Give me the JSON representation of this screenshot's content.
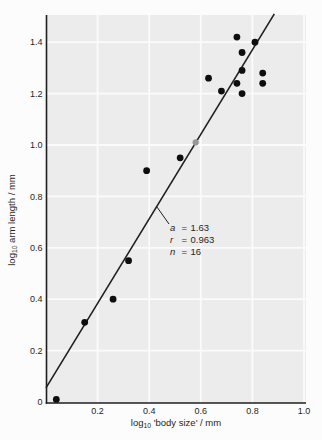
{
  "chart_data": {
    "type": "scatter",
    "title": "",
    "xlabel": {
      "pre": "log",
      "sub": "10",
      "rest": " 'body size' / mm"
    },
    "ylabel": {
      "pre": "log",
      "sub": "10",
      "rest": " arm length / mm"
    },
    "xlim": [
      0,
      1.0
    ],
    "ylim": [
      0,
      1.51
    ],
    "grid": true,
    "x_ticks": [
      0.2,
      0.4,
      0.6,
      0.8,
      1.0
    ],
    "x_tick_labels": [
      "0.2",
      "0.4",
      "0.6",
      "0.8",
      "1.0"
    ],
    "y_ticks": [
      0,
      0.2,
      0.4,
      0.6,
      0.8,
      1.0,
      1.2,
      1.4
    ],
    "y_tick_labels": [
      "0",
      "0.2",
      "0.4",
      "0.6",
      "0.8",
      "1.0",
      "1.2",
      "1.4"
    ],
    "points": [
      [
        0.04,
        0.01
      ],
      [
        0.15,
        0.31
      ],
      [
        0.26,
        0.4
      ],
      [
        0.32,
        0.55
      ],
      [
        0.39,
        0.9
      ],
      [
        0.52,
        0.95
      ],
      [
        0.63,
        1.26
      ],
      [
        0.68,
        1.21
      ],
      [
        0.74,
        1.42
      ],
      [
        0.76,
        1.36
      ],
      [
        0.81,
        1.4
      ],
      [
        0.76,
        1.29
      ],
      [
        0.74,
        1.24
      ],
      [
        0.76,
        1.2
      ],
      [
        0.84,
        1.28
      ],
      [
        0.84,
        1.24
      ]
    ],
    "highlighted_point": {
      "x": 0.58,
      "y": 1.01,
      "color": "#979797"
    },
    "fit_line": {
      "draw_from": [
        0,
        0.055
      ],
      "draw_to": [
        0.885,
        1.51
      ]
    },
    "annotation": {
      "lines": [
        {
          "var": "a",
          "eq": "=",
          "value": "1.63"
        },
        {
          "var": "r",
          "eq": "=",
          "value": "0.963"
        },
        {
          "var": "n",
          "eq": "=",
          "value": "16"
        }
      ]
    },
    "colors": {
      "plot_bg": "#ececec",
      "grid": "#fbfbfb",
      "axis": "#1f1f1f",
      "line": "#1f1f1f",
      "point": "#0e0e0e",
      "text": "#1f1f1f"
    }
  }
}
